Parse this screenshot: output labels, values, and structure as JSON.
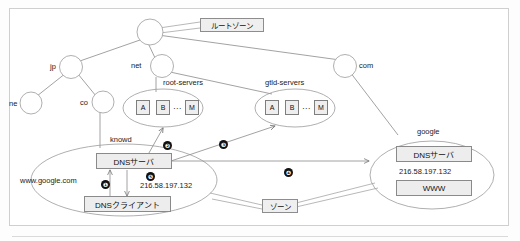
{
  "diagram": {
    "callouts": {
      "root_zone": "ルートゾーン",
      "zone": "ゾーン",
      "knowd": "knowd",
      "google_zone": "google"
    },
    "tree_nodes": [
      {
        "id": "root",
        "label": ""
      },
      {
        "id": "jp",
        "label": "jp"
      },
      {
        "id": "net",
        "label": "net"
      },
      {
        "id": "com",
        "label": "com"
      },
      {
        "id": "ne",
        "label": "ne"
      },
      {
        "id": "co",
        "label": "co"
      }
    ],
    "server_groups": [
      {
        "id": "root-servers",
        "label": "root-servers",
        "members": [
          "A",
          "B",
          "M"
        ],
        "ellipsis": "⋯"
      },
      {
        "id": "gtld-servers",
        "label": "gtld-servers",
        "members": [
          "A",
          "B",
          "M"
        ],
        "ellipsis": "⋯"
      }
    ],
    "local_zone": {
      "dns_server": "DNSサーバ",
      "dns_client": "DNSクライアント",
      "query_name": "www.google.com",
      "answer_ip": "216.58.197.132"
    },
    "google_zone": {
      "name": "google",
      "dns_server": "DNSサーバ",
      "record_ip": "216.58.197.132",
      "www_record": "WWW"
    },
    "flow_markers": [
      {
        "n": "❶",
        "step": 1
      },
      {
        "n": "❷",
        "step": 2
      },
      {
        "n": "❸",
        "step": 3
      },
      {
        "n": "❹",
        "step": 4
      },
      {
        "n": "❺",
        "step": 5
      }
    ],
    "colors": {
      "line": "#8a8a8a",
      "box_fill": "#ededed",
      "box_border": "#8a8a8a",
      "marker_fill": "#111111",
      "frame": "#cfcfcf"
    }
  }
}
